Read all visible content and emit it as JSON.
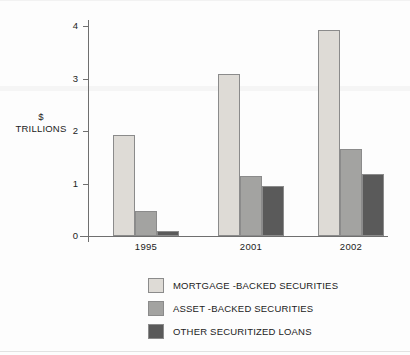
{
  "chart_data": {
    "type": "bar",
    "title": "",
    "xlabel": "",
    "ylabel": "$ TRILLIONS",
    "ylabel_lines": [
      "$",
      "TRILLIONS"
    ],
    "categories": [
      "1995",
      "2001",
      "2002"
    ],
    "ylim": [
      0,
      4
    ],
    "yticks": [
      0,
      1,
      2,
      3,
      4
    ],
    "ytick_labels": [
      "0",
      "1",
      "2",
      "3",
      "4"
    ],
    "grid": false,
    "legend_position": "bottom",
    "series": [
      {
        "name": "MORTGAGE -BACKED SECURITIES",
        "color": "#dedbd6",
        "values": [
          1.92,
          3.08,
          3.93
        ]
      },
      {
        "name": "ASSET -BACKED SECURITIES",
        "color": "#a3a3a1",
        "values": [
          0.47,
          1.15,
          1.66
        ]
      },
      {
        "name": "OTHER SECURITIZED LOANS",
        "color": "#5a5a5a",
        "values": [
          0.1,
          0.96,
          1.19
        ]
      }
    ]
  },
  "axis": {
    "y_title_line1": "$",
    "y_title_line2": "TRILLIONS",
    "ticks": [
      {
        "label": "4",
        "value": 4
      },
      {
        "label": "3",
        "value": 3
      },
      {
        "label": "2",
        "value": 2
      },
      {
        "label": "1",
        "value": 1
      },
      {
        "label": "0",
        "value": 0
      }
    ],
    "categories": [
      {
        "label": "1995"
      },
      {
        "label": "2001"
      },
      {
        "label": "2002"
      }
    ]
  },
  "legend": {
    "items": [
      {
        "label": "MORTGAGE -BACKED SECURITIES",
        "color": "#dedbd6"
      },
      {
        "label": "ASSET -BACKED SECURITIES",
        "color": "#a3a3a1"
      },
      {
        "label": "OTHER SECURITIZED LOANS",
        "color": "#5a5a5a"
      }
    ]
  },
  "colors": {
    "axis": "#6f6f6f",
    "bar_border": "#8b8b8b",
    "text": "#222222",
    "background": "#fdfdfd"
  }
}
